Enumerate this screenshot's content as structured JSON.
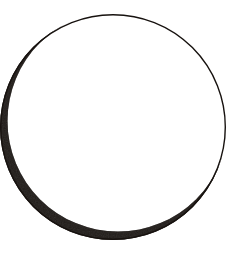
{
  "canvas": {
    "width": 234,
    "height": 264,
    "background_color": "#ffffff",
    "title": "Crescent Ring"
  },
  "figure": {
    "name": "crescent-ring",
    "stroke_color": "#17120f",
    "fill_color": "#17120f",
    "outer_circle": {
      "center_x": 113,
      "center_y": 127,
      "radius": 113
    },
    "inner_circle": {
      "center_x": 118,
      "center_y": 121,
      "radius": 110.5
    },
    "min_thickness_px": 1.4,
    "max_thickness_px": 12,
    "thickest_angle_deg": 225,
    "thinnest_angle_deg": 45
  },
  "labels": {
    "figure_caption": ""
  }
}
